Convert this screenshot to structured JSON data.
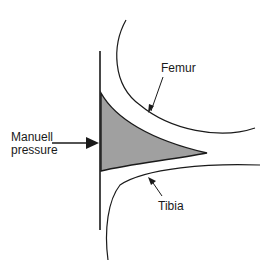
{
  "diagram": {
    "labels": {
      "femur": "Femur",
      "tibia": "Tibia",
      "pressure_line1": "Manuell",
      "pressure_line2": "pressure"
    },
    "colors": {
      "stroke": "#1a1a1a",
      "fill": "#a0a0a0",
      "background": "#ffffff"
    }
  }
}
